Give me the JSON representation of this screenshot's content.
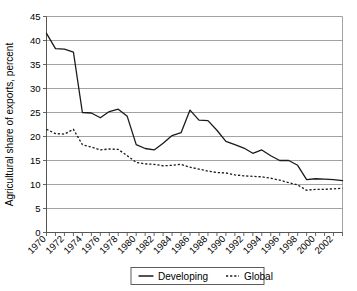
{
  "chart_data": {
    "type": "line",
    "title": "",
    "xlabel": "",
    "ylabel": "Agricultural share of exports, percent",
    "ylim": [
      0,
      45
    ],
    "ytick_step": 5,
    "yticks": [
      "0",
      "5",
      "10",
      "15",
      "20",
      "25",
      "30",
      "35",
      "40",
      "45"
    ],
    "xlim": [
      1970,
      2003
    ],
    "grid": "horizontal",
    "legend_position": "bottom-center",
    "x": [
      1970,
      1971,
      1972,
      1973,
      1974,
      1975,
      1976,
      1977,
      1978,
      1979,
      1980,
      1981,
      1982,
      1983,
      1984,
      1985,
      1986,
      1987,
      1988,
      1989,
      1990,
      1991,
      1992,
      1993,
      1994,
      1995,
      1996,
      1997,
      1998,
      1999,
      2000,
      2001,
      2002,
      2003
    ],
    "xtick_labels": [
      "1970",
      "1972",
      "1974",
      "1976",
      "1978",
      "1980",
      "1982",
      "1984",
      "1986",
      "1988",
      "1990",
      "1992",
      "1994",
      "1996",
      "1998",
      "2000",
      "2002"
    ],
    "xtick_label_rotation": -45,
    "series": [
      {
        "name": "Developing",
        "style": "solid",
        "color": "#1a1a1a",
        "values": [
          41.5,
          38.3,
          38.2,
          37.6,
          25.0,
          24.9,
          23.9,
          25.2,
          25.7,
          24.2,
          18.3,
          17.5,
          17.2,
          18.6,
          20.2,
          20.8,
          25.5,
          23.4,
          23.3,
          21.3,
          19.0,
          18.3,
          17.6,
          16.5,
          17.2,
          16.0,
          15.0,
          15.0,
          14.0,
          11.0,
          11.2,
          11.1,
          11.0,
          10.8
        ]
      },
      {
        "name": "Global",
        "style": "dotted",
        "color": "#1a1a1a",
        "values": [
          21.5,
          20.6,
          20.5,
          21.5,
          18.3,
          17.8,
          17.2,
          17.4,
          17.3,
          16.0,
          14.6,
          14.3,
          14.2,
          13.9,
          14.0,
          14.2,
          13.6,
          13.2,
          12.8,
          12.5,
          12.4,
          12.0,
          11.8,
          11.7,
          11.6,
          11.3,
          10.9,
          10.4,
          9.9,
          8.8,
          9.0,
          9.0,
          9.1,
          9.2
        ]
      }
    ]
  },
  "legend": {
    "items": [
      {
        "label": "Developing",
        "style": "solid"
      },
      {
        "label": "Global",
        "style": "dotted"
      }
    ]
  },
  "axes": {
    "y_title": "Agricultural share of exports, percent"
  }
}
